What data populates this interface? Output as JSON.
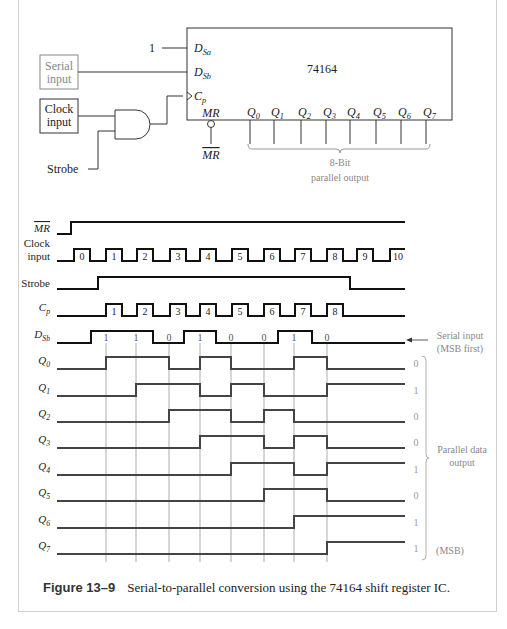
{
  "circuit": {
    "chip_label": "74164",
    "inputs": {
      "dsa_const": "1",
      "dsa_pin": "D",
      "dsa_sub": "Sa",
      "dsb_pin": "D",
      "dsb_sub": "Sb",
      "cp_pin": "C",
      "cp_sub": "p",
      "mr_pin": "MR",
      "mr_bar_label": "MR"
    },
    "serial_input_box": [
      "Serial",
      "input"
    ],
    "clock_input_box": [
      "Clock",
      "input"
    ],
    "strobe_label": "Strobe",
    "outputs": [
      "0",
      "1",
      "2",
      "3",
      "4",
      "5",
      "6",
      "7"
    ],
    "output_letter": "Q",
    "parallel_output_label": [
      "8-Bit",
      "parallel output"
    ]
  },
  "timing": {
    "rows": [
      {
        "label": "MR",
        "overline": true
      },
      {
        "label": "Clock input"
      },
      {
        "label": "Strobe"
      },
      {
        "label": "C",
        "sub": "p"
      },
      {
        "label": "D",
        "sub": "Sb"
      },
      {
        "label": "Q",
        "sub": "0"
      },
      {
        "label": "Q",
        "sub": "1"
      },
      {
        "label": "Q",
        "sub": "2"
      },
      {
        "label": "Q",
        "sub": "3"
      },
      {
        "label": "Q",
        "sub": "4"
      },
      {
        "label": "Q",
        "sub": "5"
      },
      {
        "label": "Q",
        "sub": "6"
      },
      {
        "label": "Q",
        "sub": "7"
      }
    ],
    "clock_pulse_numbers": [
      "0",
      "1",
      "2",
      "3",
      "4",
      "5",
      "6",
      "7",
      "8",
      "9",
      "10"
    ],
    "cp_pulse_numbers": [
      "1",
      "2",
      "3",
      "4",
      "5",
      "6",
      "7",
      "8"
    ],
    "dsb_bits": [
      "1",
      "1",
      "0",
      "1",
      "0",
      "0",
      "1",
      "0"
    ],
    "final_values": [
      "0",
      "1",
      "0",
      "0",
      "1",
      "0",
      "1",
      "1"
    ],
    "serial_input_note": [
      "Serial input",
      "(MSB first)"
    ],
    "parallel_data_note": [
      "Parallel data",
      "output"
    ],
    "msb_note": "(MSB)"
  },
  "caption": {
    "figure": "Figure 13–9",
    "text": "Serial-to-parallel conversion using the 74164 shift register IC."
  }
}
